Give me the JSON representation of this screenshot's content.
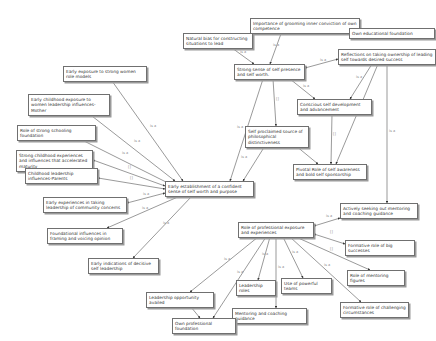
{
  "diagram": {
    "type": "network-view",
    "edge_color": "#555555",
    "nodes": [
      {
        "id": "n1",
        "label": "Importance of grooming inner conviction of own competence",
        "x": 250,
        "y": 18,
        "w": 110,
        "h": 13
      },
      {
        "id": "n2",
        "label": "Own educational foundation",
        "x": 349,
        "y": 28,
        "w": 86,
        "h": 9
      },
      {
        "id": "n3",
        "label": "Natural bias for constructing situations to lead",
        "x": 183,
        "y": 33,
        "w": 70,
        "h": 15
      },
      {
        "id": "n4",
        "label": "Strong sense of self presence and self worth.",
        "x": 234,
        "y": 64,
        "w": 71,
        "h": 15
      },
      {
        "id": "n5",
        "label": "Reflections on taking ownership of leading self towards desired success",
        "x": 338,
        "y": 49,
        "w": 98,
        "h": 15
      },
      {
        "id": "n6",
        "label": "Early exposure to strong women role models",
        "x": 63,
        "y": 66,
        "w": 84,
        "h": 15
      },
      {
        "id": "n7",
        "label": "Early childhood exposure to women leadership influences-Mother",
        "x": 28,
        "y": 94,
        "w": 82,
        "h": 15
      },
      {
        "id": "n8",
        "label": "Conscious self development and advancement",
        "x": 297,
        "y": 99,
        "w": 75,
        "h": 15
      },
      {
        "id": "n9",
        "label": "Self proclaimed source of philosophical distinctiveness",
        "x": 245,
        "y": 126,
        "w": 64,
        "h": 15
      },
      {
        "id": "n10",
        "label": "Role of strong schooling foundation",
        "x": 17,
        "y": 125,
        "w": 79,
        "h": 9
      },
      {
        "id": "n11",
        "label": "Pivotal Role of self awareness and bold self sponsorship",
        "x": 293,
        "y": 164,
        "w": 74,
        "h": 15
      },
      {
        "id": "n12",
        "label": "Strong childhood experiences and influences that accelerated maturity",
        "x": 16,
        "y": 150,
        "w": 77,
        "h": 15
      },
      {
        "id": "n13",
        "label": "Childhood leadership influences-Parents",
        "x": 25,
        "y": 168,
        "w": 73,
        "h": 15
      },
      {
        "id": "n14",
        "label": "Early establishment of a confident sense of self worth and purpose",
        "x": 165,
        "y": 181,
        "w": 89,
        "h": 15
      },
      {
        "id": "n15",
        "label": "Early experiences in taking leadership of community concerns",
        "x": 43,
        "y": 197,
        "w": 84,
        "h": 15
      },
      {
        "id": "n16",
        "label": "Foundational influences in framing and voicing opinion",
        "x": 47,
        "y": 228,
        "w": 76,
        "h": 15
      },
      {
        "id": "n17",
        "label": "Early indications of decisive self leadership",
        "x": 88,
        "y": 258,
        "w": 71,
        "h": 15
      },
      {
        "id": "n18",
        "label": "Actively seeking out mentoring and coaching guidance",
        "x": 340,
        "y": 203,
        "w": 78,
        "h": 15
      },
      {
        "id": "n19",
        "label": "Role of professional exposure and experiences",
        "x": 238,
        "y": 222,
        "w": 76,
        "h": 15
      },
      {
        "id": "n20",
        "label": "Formative role of big successes",
        "x": 345,
        "y": 240,
        "w": 70,
        "h": 9
      },
      {
        "id": "n21",
        "label": "Leadership opportunity availed",
        "x": 146,
        "y": 292,
        "w": 68,
        "h": 9
      },
      {
        "id": "n22",
        "label": "Leadership roles",
        "x": 236,
        "y": 280,
        "w": 40,
        "h": 9
      },
      {
        "id": "n23",
        "label": "Use of powerful teams",
        "x": 281,
        "y": 278,
        "w": 51,
        "h": 9
      },
      {
        "id": "n24",
        "label": "Role of mentoring figures",
        "x": 347,
        "y": 270,
        "w": 58,
        "h": 9
      },
      {
        "id": "n25",
        "label": "Mentoring and coaching guidance",
        "x": 232,
        "y": 308,
        "w": 75,
        "h": 9
      },
      {
        "id": "n26",
        "label": "Formative role of challenging circumstances",
        "x": 340,
        "y": 302,
        "w": 69,
        "h": 15
      },
      {
        "id": "n27",
        "label": "Own professional foundation",
        "x": 172,
        "y": 318,
        "w": 64,
        "h": 9
      }
    ],
    "edges": [
      {
        "from": "n4",
        "to": "n1",
        "x1": 270,
        "y1": 64,
        "x2": 282,
        "y2": 31,
        "label": "is a",
        "lx": 273,
        "ly": 46
      },
      {
        "from": "n1",
        "to": "n2",
        "x1": 360,
        "y1": 28,
        "x2": 349,
        "y2": 32,
        "label": "[]",
        "lx": 334,
        "ly": 25
      },
      {
        "from": "n4",
        "to": "n3",
        "x1": 254,
        "y1": 64,
        "x2": 232,
        "y2": 48,
        "label": "is a",
        "lx": 240,
        "ly": 53
      },
      {
        "from": "n4",
        "to": "n5",
        "x1": 305,
        "y1": 68,
        "x2": 338,
        "y2": 59,
        "label": "is a",
        "lx": 320,
        "ly": 61
      },
      {
        "from": "n4",
        "to": "n8",
        "x1": 290,
        "y1": 79,
        "x2": 315,
        "y2": 99,
        "label": "is a",
        "lx": 303,
        "ly": 87
      },
      {
        "from": "n5",
        "to": "n8",
        "x1": 372,
        "y1": 64,
        "x2": 350,
        "y2": 99,
        "label": "is a",
        "lx": 356,
        "ly": 78
      },
      {
        "from": "n5",
        "to": "n11",
        "x1": 378,
        "y1": 64,
        "x2": 336,
        "y2": 164,
        "label": "",
        "lx": 0,
        "ly": 0
      },
      {
        "from": "n18",
        "to": "n5",
        "x1": 387,
        "y1": 203,
        "x2": 387,
        "y2": 64,
        "label": "is a",
        "lx": 389,
        "ly": 132
      },
      {
        "from": "n8",
        "to": "n11",
        "x1": 332,
        "y1": 114,
        "x2": 331,
        "y2": 164,
        "label": "[]",
        "lx": 333,
        "ly": 135
      },
      {
        "from": "n9",
        "to": "n11",
        "x1": 290,
        "y1": 141,
        "x2": 318,
        "y2": 164,
        "label": "[]",
        "lx": 305,
        "ly": 148
      },
      {
        "from": "n9",
        "to": "n4",
        "x1": 276,
        "y1": 126,
        "x2": 273,
        "y2": 79,
        "label": "[]",
        "lx": 276,
        "ly": 100
      },
      {
        "from": "n14",
        "to": "n4",
        "x1": 230,
        "y1": 181,
        "x2": 263,
        "y2": 79,
        "label": "is a",
        "lx": 237,
        "ly": 128
      },
      {
        "from": "n14",
        "to": "n9",
        "x1": 243,
        "y1": 181,
        "x2": 268,
        "y2": 141,
        "label": "is a",
        "lx": 241,
        "ly": 158
      },
      {
        "from": "n14",
        "to": "n6",
        "x1": 183,
        "y1": 181,
        "x2": 112,
        "y2": 81,
        "label": "is a",
        "lx": 150,
        "ly": 127
      },
      {
        "from": "n14",
        "to": "n7",
        "x1": 175,
        "y1": 181,
        "x2": 83,
        "y2": 109,
        "label": "is a",
        "lx": 134,
        "ly": 142
      },
      {
        "from": "n14",
        "to": "n10",
        "x1": 168,
        "y1": 183,
        "x2": 70,
        "y2": 134,
        "label": "is a",
        "lx": 122,
        "ly": 154
      },
      {
        "from": "n12",
        "to": "n14",
        "x1": 93,
        "y1": 160,
        "x2": 165,
        "y2": 186,
        "label": "[]",
        "lx": 128,
        "ly": 168
      },
      {
        "from": "n13",
        "to": "n14",
        "x1": 98,
        "y1": 178,
        "x2": 165,
        "y2": 189,
        "label": "[]",
        "lx": 130,
        "ly": 179
      },
      {
        "from": "n15",
        "to": "n14",
        "x1": 127,
        "y1": 203,
        "x2": 165,
        "y2": 193,
        "label": "is a",
        "lx": 143,
        "ly": 195
      },
      {
        "from": "n14",
        "to": "n16",
        "x1": 180,
        "y1": 196,
        "x2": 107,
        "y2": 228,
        "label": "is a",
        "lx": 142,
        "ly": 209
      },
      {
        "from": "n14",
        "to": "n17",
        "x1": 192,
        "y1": 196,
        "x2": 133,
        "y2": 258,
        "label": "is a",
        "lx": 163,
        "ly": 224
      },
      {
        "from": "n19",
        "to": "n18",
        "x1": 314,
        "y1": 226,
        "x2": 340,
        "y2": 218,
        "label": "is a",
        "lx": 326,
        "ly": 217
      },
      {
        "from": "n20",
        "to": "n19",
        "x1": 345,
        "y1": 244,
        "x2": 314,
        "y2": 234,
        "label": "[]",
        "lx": 330,
        "ly": 233
      },
      {
        "from": "n24",
        "to": "n19",
        "x1": 370,
        "y1": 270,
        "x2": 296,
        "y2": 237,
        "label": "[]",
        "lx": 330,
        "ly": 250
      },
      {
        "from": "n19",
        "to": "n26",
        "x1": 290,
        "y1": 237,
        "x2": 361,
        "y2": 302,
        "label": "is a",
        "lx": 324,
        "ly": 266
      },
      {
        "from": "n19",
        "to": "n23",
        "x1": 283,
        "y1": 237,
        "x2": 303,
        "y2": 278,
        "label": "is a",
        "lx": 292,
        "ly": 253
      },
      {
        "from": "n25",
        "to": "n19",
        "x1": 276,
        "y1": 308,
        "x2": 276,
        "y2": 237,
        "label": "is a",
        "lx": 278,
        "ly": 268
      },
      {
        "from": "n19",
        "to": "n22",
        "x1": 270,
        "y1": 237,
        "x2": 258,
        "y2": 280,
        "label": "is a",
        "lx": 262,
        "ly": 255
      },
      {
        "from": "n19",
        "to": "n21",
        "x1": 258,
        "y1": 237,
        "x2": 190,
        "y2": 292,
        "label": "is a",
        "lx": 224,
        "ly": 260
      },
      {
        "from": "n27",
        "to": "n19",
        "x1": 213,
        "y1": 318,
        "x2": 266,
        "y2": 237,
        "label": "is a",
        "lx": 237,
        "ly": 273
      },
      {
        "from": "n21",
        "to": "n27",
        "x1": 186,
        "y1": 301,
        "x2": 200,
        "y2": 318,
        "label": "is a",
        "lx": 193,
        "ly": 308
      }
    ]
  }
}
